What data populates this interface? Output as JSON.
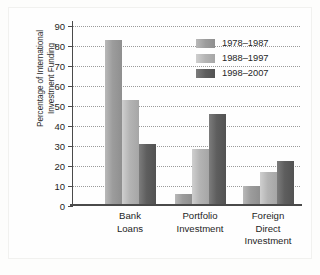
{
  "chart_data": {
    "type": "bar",
    "title": "",
    "xlabel": "",
    "ylabel": "Percentage of International Investment Funding",
    "ylabel_lines": [
      "Percentage of International",
      "Investment Funding"
    ],
    "categories": [
      "Bank Loans",
      "Portfolio Investment",
      "Foreign Direct Investment"
    ],
    "category_label_lines": [
      [
        "Bank",
        "Loans"
      ],
      [
        "Portfolio",
        "Investment"
      ],
      [
        "Foreign",
        "Direct",
        "Investment"
      ]
    ],
    "series": [
      {
        "name": "1978–1987",
        "values": [
          83,
          6,
          10
        ],
        "color": "#9c9c9c"
      },
      {
        "name": "1988–1997",
        "values": [
          53,
          28.5,
          17
        ],
        "color": "#b4b4b4"
      },
      {
        "name": "1998–2007",
        "values": [
          31,
          46,
          22.5
        ],
        "color": "#5e5e5e"
      }
    ],
    "ylim": [
      0,
      90
    ],
    "yticks": [
      0,
      10,
      20,
      30,
      40,
      50,
      60,
      70,
      80,
      90
    ],
    "ytick_labels": [
      "0",
      "10",
      "20",
      "30",
      "40",
      "50",
      "60",
      "70",
      "80",
      "90"
    ],
    "grid": true,
    "grid_style": "dotted",
    "legend_position": "top-right",
    "legend_entries": [
      "1978–1987",
      "1988–1997",
      "1998–2007"
    ]
  }
}
